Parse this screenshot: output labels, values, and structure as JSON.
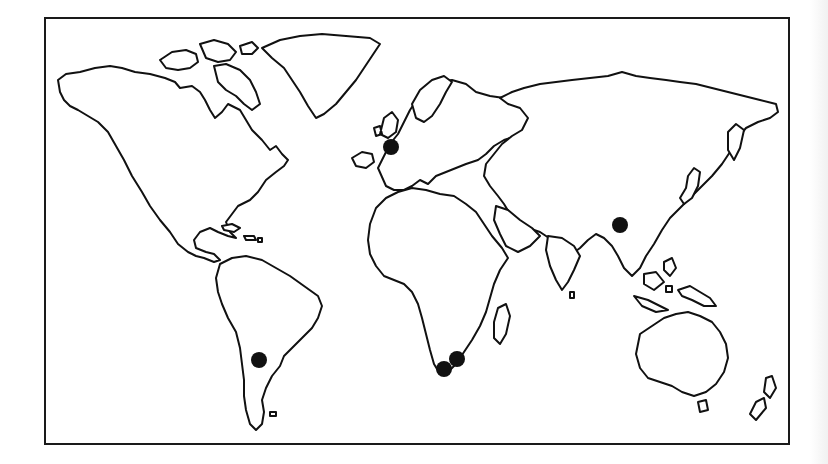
{
  "map": {
    "type": "world-outline",
    "projection": "equirectangular-like",
    "colors": {
      "background": "#ffffff",
      "land_fill": "#ffffff",
      "coastline": "#111111",
      "marker": "#111111",
      "frame": "#1a1a1a"
    },
    "markers": [
      {
        "id": "m1",
        "region": "Western Europe (UK / France)",
        "cx": 391,
        "cy": 147,
        "r": 8
      },
      {
        "id": "m2",
        "region": "Southern Africa (Cape)",
        "cx": 444,
        "cy": 369,
        "r": 8
      },
      {
        "id": "m3",
        "region": "Southern Africa (East)",
        "cx": 457,
        "cy": 359,
        "r": 8
      },
      {
        "id": "m4",
        "region": "Southern China",
        "cx": 620,
        "cy": 225,
        "r": 8
      },
      {
        "id": "m5",
        "region": "Argentina",
        "cx": 259,
        "cy": 360,
        "r": 8
      }
    ]
  }
}
